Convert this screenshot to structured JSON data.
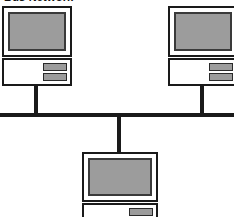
{
  "diagram": {
    "title": "Bus Network",
    "type": "bus-network-topology",
    "colors": {
      "line": "#1a1a1a",
      "screen_gray": "#9c9c9c",
      "bay_gray": "#9c9c9c",
      "case_white": "#ffffff",
      "background": "#ffffff"
    },
    "nodes": [
      {
        "id": "computer-top-left",
        "label": "",
        "monitor": {
          "x": 2,
          "y": 6,
          "width": 70,
          "height": 51
        },
        "system_unit": {
          "x": 2,
          "y": 58,
          "width": 70,
          "height": 28
        },
        "drive_bays": 2,
        "drop_line": {
          "x": 34,
          "y": 86,
          "width": 4,
          "height": 29
        }
      },
      {
        "id": "computer-top-right",
        "label": "",
        "monitor": {
          "x": 168,
          "y": 6,
          "width": 70,
          "height": 51
        },
        "system_unit": {
          "x": 168,
          "y": 58,
          "width": 70,
          "height": 28
        },
        "drive_bays": 2,
        "drop_line": {
          "x": 200,
          "y": 86,
          "width": 4,
          "height": 29
        }
      },
      {
        "id": "computer-bottom-center",
        "label": "",
        "monitor": {
          "x": 82,
          "y": 152,
          "width": 76,
          "height": 50
        },
        "system_unit": {
          "x": 82,
          "y": 203,
          "width": 76,
          "height": 28
        },
        "drive_bays": 2,
        "drop_line": {
          "x": 117,
          "y": 117,
          "width": 4,
          "height": 36
        }
      }
    ],
    "bus": {
      "x": 0,
      "y": 113,
      "width": 234,
      "height": 4
    }
  }
}
